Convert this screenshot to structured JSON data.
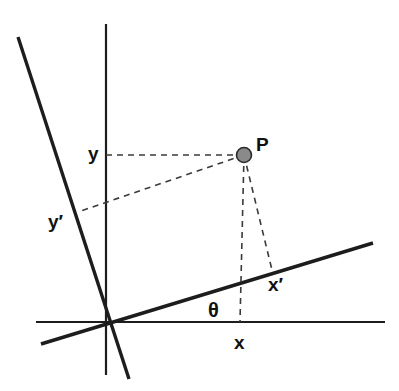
{
  "diagram": {
    "background_color": "#ffffff",
    "line_color": "#1d1d1d",
    "dash_color": "#3a3a3a",
    "point_fill_color": "#8a8a8a",
    "point_stroke_color": "#2a2a2a",
    "canvas": {
      "width": 399,
      "height": 391
    },
    "origin": {
      "x": 105,
      "y": 322
    }
  },
  "axes": [
    {
      "name": "x-axis",
      "label": "x-axis-unprimed",
      "x1": 36,
      "y1": 322,
      "x2": 385,
      "y2": 322,
      "weight": "thin"
    },
    {
      "name": "y-axis",
      "label": "y-axis-unprimed",
      "x1": 106,
      "y1": 24,
      "x2": 106,
      "y2": 375,
      "weight": "thin"
    },
    {
      "name": "x-prime-axis",
      "label": "x-axis-primed",
      "x1": 41,
      "y1": 344,
      "x2": 373,
      "y2": 243,
      "weight": "thick"
    },
    {
      "name": "y-prime-axis",
      "label": "y-axis-primed",
      "x1": 18,
      "y1": 37,
      "x2": 129,
      "y2": 379,
      "weight": "thick"
    }
  ],
  "point": {
    "name": "P",
    "label": "P",
    "x": 244,
    "y": 155,
    "radius": 7.5
  },
  "projections": [
    {
      "name": "projection-to-y-axis",
      "from_x": 244,
      "from_y": 155,
      "to_x": 106,
      "to_y": 155
    },
    {
      "name": "projection-to-y-prime-axis",
      "from_x": 244,
      "from_y": 155,
      "to_x": 78,
      "to_y": 212
    },
    {
      "name": "projection-to-x-axis",
      "from_x": 244,
      "from_y": 155,
      "to_x": 240,
      "to_y": 322
    },
    {
      "name": "projection-to-x-prime-axis",
      "from_x": 244,
      "from_y": 155,
      "to_x": 272,
      "to_y": 270
    }
  ],
  "labels": {
    "y": {
      "text": "y",
      "x": 88,
      "y": 144
    },
    "y_prime": {
      "text": "y′",
      "x": 48,
      "y": 212
    },
    "p": {
      "text": "P",
      "x": 256,
      "y": 135
    },
    "x_prime": {
      "text": "x′",
      "x": 268,
      "y": 275
    },
    "theta": {
      "text": "θ",
      "x": 208,
      "y": 300
    },
    "x": {
      "text": "x",
      "x": 234,
      "y": 333
    }
  }
}
